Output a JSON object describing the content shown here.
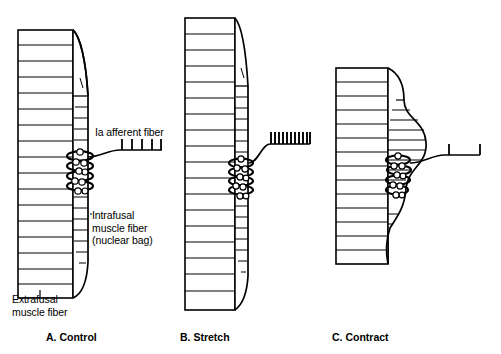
{
  "figure": {
    "type": "biological-diagram",
    "background_color": "#ffffff",
    "line_color": "#000000",
    "width": 501,
    "height": 354
  },
  "labels": {
    "afferent_fiber": "Ia afferent fiber",
    "intrafusal_fiber": "Intrafusal\nmuscle fiber\n(nuclear bag)",
    "extrafusal_fiber": "Extrafusal\nmuscle fiber"
  },
  "panels": [
    {
      "id": "panel-a",
      "caption": "A. Control",
      "state": "control",
      "extrafusal": {
        "x": 18,
        "y": 30,
        "width": 55,
        "height": 268,
        "striation_count": 17
      },
      "intrafusal": {
        "shape": "spindle",
        "state": "resting",
        "nuclear_bag_present": true
      },
      "spike_train": {
        "count": 5,
        "spacing": "regular",
        "rate": "moderate",
        "x": 120,
        "y": 141,
        "width": 42,
        "spike_height": 11
      },
      "nuclei_circles": 8
    },
    {
      "id": "panel-b",
      "caption": "B. Stretch",
      "state": "stretch",
      "extrafusal": {
        "x": 185,
        "y": 18,
        "width": 50,
        "height": 292,
        "striation_count": 18
      },
      "intrafusal": {
        "shape": "elongated-spindle",
        "state": "stretched",
        "nuclear_bag_present": true
      },
      "spike_train": {
        "count": 11,
        "spacing": "dense",
        "rate": "high",
        "x": 268,
        "y": 134,
        "width": 42,
        "spike_height": 12
      },
      "nuclei_circles": 8
    },
    {
      "id": "panel-c",
      "caption": "C. Contract",
      "state": "contract",
      "extrafusal": {
        "x": 336,
        "y": 68,
        "width": 52,
        "height": 196,
        "striation_count": 14
      },
      "intrafusal": {
        "shape": "bulged-spindle",
        "state": "slackened",
        "nuclear_bag_present": true
      },
      "spike_train": {
        "count": 2,
        "spacing": "sparse",
        "rate": "low",
        "x": 448,
        "y": 145,
        "width": 32,
        "spike_height": 11
      },
      "nuclei_circles": 8
    }
  ]
}
